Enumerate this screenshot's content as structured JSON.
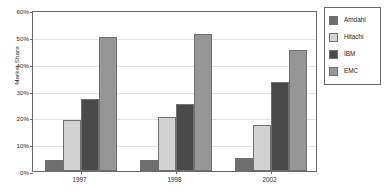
{
  "chart_data": {
    "type": "bar",
    "title": "",
    "xlabel": "",
    "ylabel": "Market Share",
    "categories": [
      "1997",
      "1998",
      "2002"
    ],
    "series": [
      {
        "name": "Amdahl",
        "color": "#6e6e6e",
        "values": [
          4,
          4,
          5
        ]
      },
      {
        "name": "Hitachi",
        "color": "#d2d2d2",
        "values": [
          19,
          20,
          17
        ]
      },
      {
        "name": "IBM",
        "color": "#4a4a4a",
        "values": [
          27,
          25,
          33
        ]
      },
      {
        "name": "EMC",
        "color": "#969696",
        "values": [
          50,
          51,
          45
        ]
      }
    ],
    "ylim": [
      0,
      60
    ],
    "ytick_step": 10,
    "ytick_labels": [
      "0%",
      "10%",
      "20%",
      "30%",
      "40%",
      "50%",
      "60%"
    ],
    "ytick_values": [
      0,
      10,
      20,
      30,
      40,
      50,
      60
    ],
    "grid": true,
    "legend_position": "right-outside"
  }
}
